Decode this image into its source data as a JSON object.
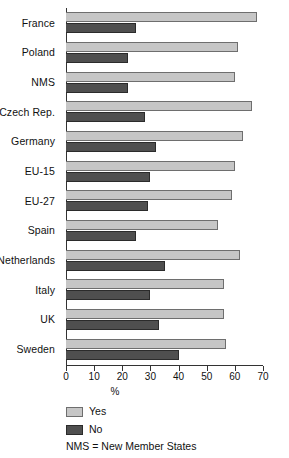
{
  "chart_data": {
    "type": "bar",
    "orientation": "horizontal",
    "title": "",
    "xlabel": "%",
    "ylabel": "",
    "xlim": [
      0,
      70
    ],
    "xticks": [
      0,
      10,
      20,
      30,
      40,
      50,
      60,
      70
    ],
    "grid": false,
    "legend_position": "bottom-left",
    "categories": [
      "France",
      "Poland",
      "NMS",
      "Czech Rep.",
      "Germany",
      "EU-15",
      "EU-27",
      "Spain",
      "Netherlands",
      "Italy",
      "UK",
      "Sweden"
    ],
    "series": [
      {
        "name": "Yes",
        "color": "#c6c6c6",
        "values": [
          68,
          61,
          60,
          66,
          63,
          60,
          59,
          54,
          62,
          56,
          56,
          57
        ]
      },
      {
        "name": "No",
        "color": "#4f4f4f",
        "values": [
          25,
          22,
          22,
          28,
          32,
          30,
          29,
          25,
          35,
          30,
          33,
          40
        ]
      }
    ],
    "annotations": [
      "NMS = New Member States"
    ]
  },
  "axis": {
    "x_title": "%",
    "tick_labels": [
      "0",
      "10",
      "20",
      "30",
      "40",
      "50",
      "60",
      "70"
    ]
  },
  "legend": {
    "items": [
      {
        "label": "Yes"
      },
      {
        "label": "No"
      }
    ]
  },
  "footnote": {
    "text": "NMS = New Member States"
  }
}
